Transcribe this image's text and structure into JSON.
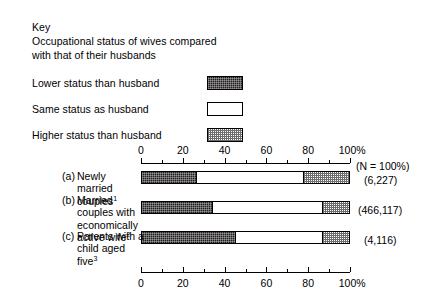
{
  "key": {
    "title": "Key",
    "description": "Occupational status of wives compared with that of their husbands",
    "legend": [
      {
        "label": "Lower status than husband",
        "pattern": "dark-crosshatch",
        "color": "#231f20"
      },
      {
        "label": "Same status as husband",
        "pattern": "white",
        "color": "#ffffff"
      },
      {
        "label": "Higher status than husband",
        "pattern": "light-stipple",
        "color": "#9a9a9a"
      }
    ]
  },
  "chart_data": {
    "type": "bar",
    "orientation": "horizontal",
    "stacked": true,
    "title": "",
    "xlabel": "",
    "ylabel": "",
    "xlim": [
      0,
      100
    ],
    "grid": false,
    "legend_position": "top-left",
    "axis": {
      "top": {
        "major_ticks": [
          0,
          20,
          40,
          60,
          80,
          100
        ],
        "minor_ticks": [
          10,
          30,
          50,
          70,
          90
        ],
        "tick_labels": [
          "0",
          "20",
          "40",
          "60",
          "80",
          "100%"
        ]
      },
      "bottom": {
        "major_ticks": [
          0,
          20,
          40,
          60,
          80,
          100
        ],
        "minor_ticks": [
          10,
          30,
          50,
          70,
          90
        ],
        "tick_labels": [
          "0",
          "20",
          "40",
          "60",
          "80",
          "100%"
        ]
      }
    },
    "n_header": "(N = 100%)",
    "series": [
      {
        "name": "Lower status than husband",
        "values": [
          26,
          34,
          45
        ]
      },
      {
        "name": "Same status as husband",
        "values": [
          52,
          53,
          42
        ]
      },
      {
        "name": "Higher status than husband",
        "values": [
          22,
          13,
          13
        ]
      }
    ],
    "categories": [
      {
        "marker": "(a)",
        "label": "Newly married couples",
        "footnote": "1",
        "n": "(6,227)"
      },
      {
        "marker": "(b)",
        "label": "Married couples with economically active wife",
        "footnote": "2",
        "n": "(466,117)"
      },
      {
        "marker": "(c)",
        "label": "Parents with a child aged five",
        "footnote": "3",
        "n": "(4,116)"
      }
    ]
  }
}
